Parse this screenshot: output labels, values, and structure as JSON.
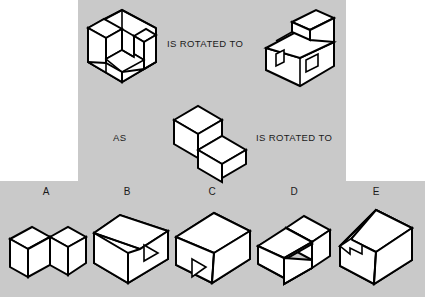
{
  "page": {
    "type": "spatial-reasoning-rotation-question",
    "background_color": "#ffffff",
    "panel_color": "#c9c9c9",
    "line_color": "#000000",
    "face_color": "#ffffff",
    "width": 425,
    "height": 297
  },
  "prompt": {
    "relation_1_label": "IS ROTATED TO",
    "as_label": "AS",
    "relation_2_label": "IS ROTATED TO",
    "figures": [
      {
        "id": "stimulus-a",
        "name": "u-channel-block",
        "description": "Isometric U-shaped channel block with a notch cut through the top"
      },
      {
        "id": "stimulus-b",
        "name": "rotated-u-channel-block",
        "description": "Same U-shaped channel block rotated, showing two notches on the front face and a raised back wall"
      },
      {
        "id": "stimulus-c",
        "name": "two-step-staircase-block",
        "description": "Isometric two-step staircase block"
      }
    ]
  },
  "options": {
    "letters": [
      "A",
      "B",
      "C",
      "D",
      "E"
    ],
    "items": [
      {
        "letter": "A",
        "name": "option-a-shape",
        "description": "V-shaped / chevron folded block seen from above"
      },
      {
        "letter": "B",
        "name": "option-b-shape",
        "description": "Rectangular block with a small triangular notch on the right front face"
      },
      {
        "letter": "C",
        "name": "option-c-shape",
        "description": "Rectangular block with a triangular notch on the lower-left front face"
      },
      {
        "letter": "D",
        "name": "option-d-shape",
        "description": "Isometric two-step staircase block facing left"
      },
      {
        "letter": "E",
        "name": "option-e-shape",
        "description": "Rectangular block with a notch cut from the upper-left front corner"
      }
    ]
  }
}
